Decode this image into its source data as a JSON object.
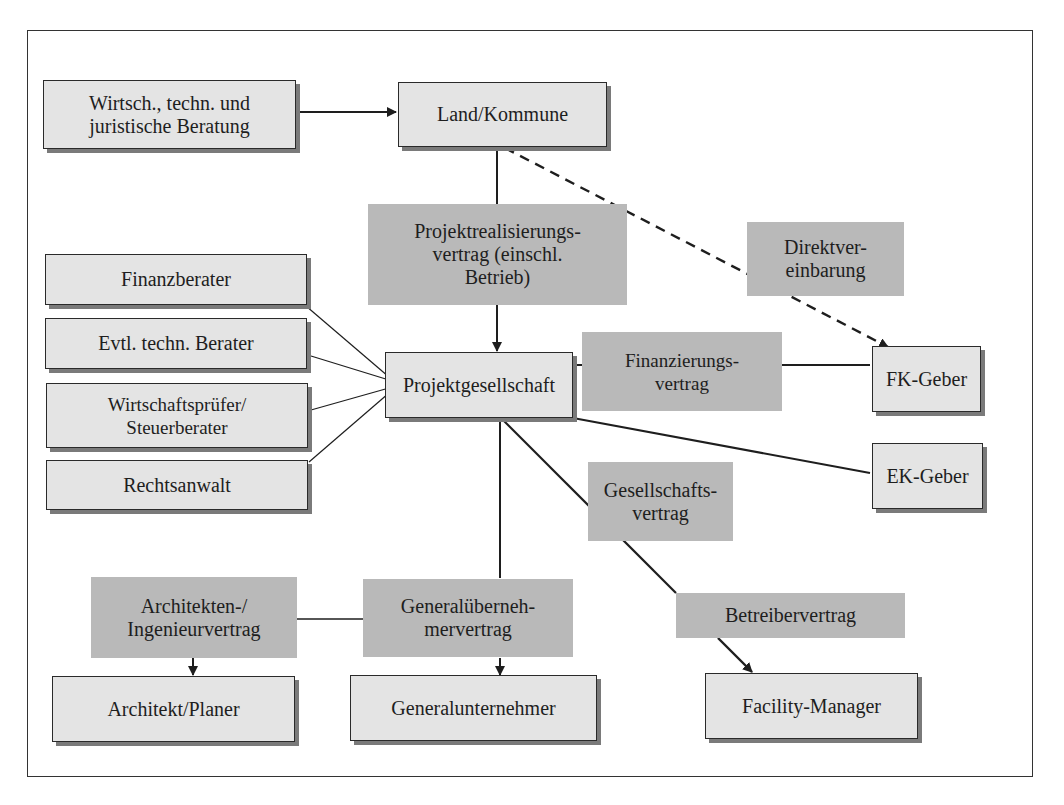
{
  "diagram": {
    "type": "organization/contract structure",
    "colors": {
      "node_fill": "#e4e4e4",
      "contract_fill": "#b9b9b9",
      "line": "#1e1e1e",
      "shadow": "#7a7a7a"
    },
    "nodes": {
      "beratung": "Wirtsch., techn. und\njuristische Beratung",
      "land": "Land/Kommune",
      "finanzberater": "Finanzberater",
      "techn_berater": "Evtl. techn. Berater",
      "wirtschaftspruefer": "Wirtschaftsprüfer/\nSteuerberater",
      "rechtsanwalt": "Rechtsanwalt",
      "projektgesellschaft": "Projektgesellschaft",
      "fk_geber": "FK-Geber",
      "ek_geber": "EK-Geber",
      "architekt": "Architekt/Planer",
      "generalunternehmer": "Generalunternehmer",
      "facility_manager": "Facility-Manager"
    },
    "contracts": {
      "projektrealisierung": "Projektrealisierungs-\nvertrag (einschl.\nBetrieb)",
      "direktvereinbarung": "Direktver-\neinbarung",
      "finanzierung": "Finanzierungs-\nvertrag",
      "gesellschaft": "Gesellschafts-\nvertrag",
      "architekten": "Architekten-/\nIngenieurvertrag",
      "generaluebernehmer": "Generalüberneh-\nmervertrag",
      "betreiber": "Betreibervertrag"
    },
    "edges": [
      {
        "from": "beratung",
        "to": "land",
        "style": "solid",
        "arrow": true
      },
      {
        "from": "land",
        "to": "projektgesellschaft",
        "via": "projektrealisierung",
        "style": "solid",
        "arrow": true
      },
      {
        "from": "land",
        "to": "fk_geber",
        "via": "direktvereinbarung",
        "style": "dashed",
        "arrow": true
      },
      {
        "from": "finanzberater",
        "to": "projektgesellschaft",
        "style": "thin"
      },
      {
        "from": "techn_berater",
        "to": "projektgesellschaft",
        "style": "thin"
      },
      {
        "from": "wirtschaftspruefer",
        "to": "projektgesellschaft",
        "style": "thin"
      },
      {
        "from": "rechtsanwalt",
        "to": "projektgesellschaft",
        "style": "thin"
      },
      {
        "from": "projektgesellschaft",
        "to": "fk_geber",
        "via": "finanzierung",
        "style": "solid"
      },
      {
        "from": "projektgesellschaft",
        "to": "ek_geber",
        "via": "gesellschaft",
        "style": "solid"
      },
      {
        "from": "projektgesellschaft",
        "to": "generalunternehmer",
        "via": "generaluebernehmer",
        "style": "solid",
        "arrow": true
      },
      {
        "from": "generaluebernehmer",
        "to": "architekt",
        "via": "architekten",
        "style": "solid",
        "arrow": true
      },
      {
        "from": "projektgesellschaft",
        "to": "facility_manager",
        "via": "betreiber",
        "style": "solid",
        "arrow": true
      }
    ]
  }
}
